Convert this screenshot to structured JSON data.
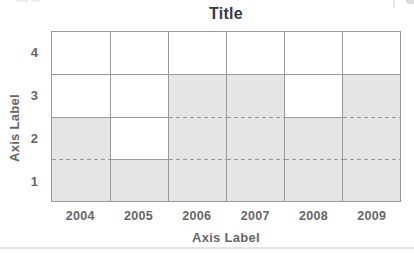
{
  "chart_data": {
    "type": "bar",
    "variant": "stepped-fill-grid",
    "title": "Title",
    "xlabel": "Axis Label",
    "ylabel": "Axis Label",
    "categories": [
      "2004",
      "2005",
      "2006",
      "2007",
      "2008",
      "2009"
    ],
    "values": [
      2.5,
      1.5,
      3.5,
      3.5,
      2.5,
      3.5
    ],
    "yticks_top_to_bottom": [
      "4",
      "3",
      "2",
      "1"
    ],
    "ylim": [
      0.5,
      4.5
    ],
    "grid": true,
    "legend": false,
    "gridline_style": "solid outside fill, dashed inside gray fill",
    "colors": {
      "fill": "#e5e5e5",
      "gridline": "#9a9a9a",
      "title_text": "#3a3a3a",
      "axis_text": "#666666",
      "background": "#ffffff",
      "bottom_rule": "#e3e3e3"
    }
  }
}
